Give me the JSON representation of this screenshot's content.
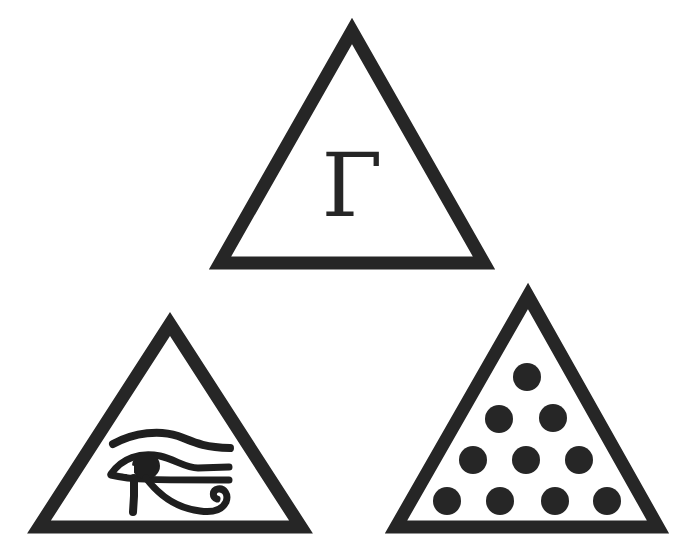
{
  "figure": {
    "background": "#ffffff",
    "ink_color": "#262626",
    "triangles": [
      {
        "id": "top",
        "symbol": "gamma",
        "label": "Γ",
        "apex": [
          352,
          30
        ],
        "base_left": [
          219,
          263
        ],
        "base_right": [
          484,
          263
        ]
      },
      {
        "id": "bottom-left",
        "symbol": "eye-of-horus",
        "label": "",
        "apex": [
          170,
          323
        ],
        "base_left": [
          38,
          527
        ],
        "base_right": [
          301,
          527
        ]
      },
      {
        "id": "bottom-right",
        "symbol": "tetractys",
        "label": "",
        "dot_count": 10,
        "rows": [
          1,
          2,
          3,
          4
        ],
        "apex": [
          528,
          295
        ],
        "base_left": [
          395,
          527
        ],
        "base_right": [
          658,
          527
        ]
      }
    ]
  }
}
